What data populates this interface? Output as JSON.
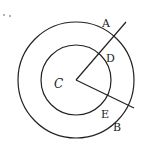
{
  "diagram": {
    "type": "concentric-circles-with-radii",
    "center_label": "C",
    "points": [
      {
        "label": "A",
        "desc": "on outer circle"
      },
      {
        "label": "D",
        "desc": "on inner circle"
      },
      {
        "label": "E",
        "desc": "on inner circle"
      },
      {
        "label": "B",
        "desc": "on outer circle"
      }
    ],
    "colors": {
      "stroke": "#222222",
      "background": "#ffffff"
    }
  }
}
